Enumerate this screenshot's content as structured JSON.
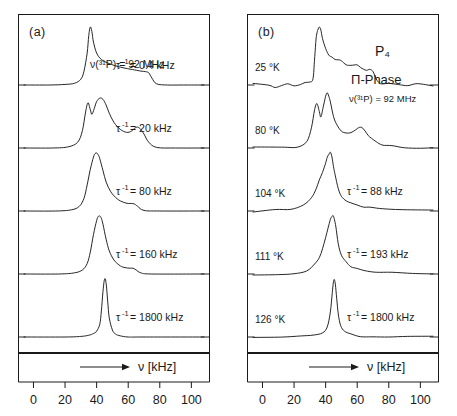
{
  "figure": {
    "background": "#ffffff",
    "line_color": "#1a1a1a",
    "panels": [
      {
        "id": "a",
        "tag": "(a)",
        "header_note": "ν(³¹P) = 92 MHz",
        "x_axis": {
          "arrow_label": "ν [kHz]",
          "ticks": [
            "0",
            "20",
            "40",
            "60",
            "80",
            "100"
          ],
          "tick_values": [
            0,
            20,
            40,
            60,
            80,
            100
          ],
          "range": [
            -6,
            108
          ],
          "unit": "kHz"
        },
        "traces": [
          {
            "label": "τ⁻¹ = 0.4 kHz",
            "tau_inv": "0.4",
            "unit": "kHz",
            "temperature": ""
          },
          {
            "label": "τ⁻¹ = 20 kHz",
            "tau_inv": "20",
            "unit": "kHz",
            "temperature": ""
          },
          {
            "label": "τ⁻¹ = 80 kHz",
            "tau_inv": "80",
            "unit": "kHz",
            "temperature": ""
          },
          {
            "label": "τ⁻¹ = 160 kHz",
            "tau_inv": "160",
            "unit": "kHz",
            "temperature": ""
          },
          {
            "label": "τ⁻¹ = 1800 kHz",
            "tau_inv": "1800",
            "unit": "kHz",
            "temperature": ""
          }
        ]
      },
      {
        "id": "b",
        "tag": "(b)",
        "title": "P₄",
        "subtitle": "Π-Phase",
        "header_note": "ν(³¹P) = 92 MHz",
        "x_axis": {
          "arrow_label": "ν [kHz]",
          "ticks": [
            "0",
            "20",
            "40",
            "60",
            "80",
            "100"
          ],
          "tick_values": [
            0,
            20,
            40,
            60,
            80,
            100
          ],
          "range": [
            -6,
            108
          ],
          "unit": "kHz"
        },
        "traces": [
          {
            "temperature": "25 °K",
            "label": ""
          },
          {
            "temperature": "80 °K",
            "label": ""
          },
          {
            "temperature": "104 °K",
            "label": "τ⁻¹ = 88 kHz",
            "tau_inv": "88",
            "unit": "kHz"
          },
          {
            "temperature": "111 °K",
            "label": "τ⁻¹ = 193 kHz",
            "tau_inv": "193",
            "unit": "kHz"
          },
          {
            "temperature": "126 °K",
            "label": "τ⁻¹ = 1800 kHz",
            "tau_inv": "1800",
            "unit": "kHz"
          }
        ]
      }
    ]
  },
  "chart_data": {
    "type": "line",
    "title": "",
    "xlabel": "ν [kHz]",
    "ylabel": "",
    "xlim": [
      -6,
      108
    ],
    "grid": false,
    "legend": "none",
    "panels": [
      {
        "panel": "(a)",
        "annotation": "ν(³¹P) = 92 MHz",
        "xticks": [
          0,
          20,
          40,
          60,
          80,
          100
        ],
        "series": [
          {
            "name": "τ⁻¹ = 0.4 kHz",
            "tau_inv_kHz": 0.4,
            "x": [
              -6,
              10,
              20,
              26,
              30,
              32,
              34,
              35,
              36,
              37,
              38,
              40,
              43,
              47,
              52,
              58,
              64,
              68,
              71,
              73,
              75,
              78,
              85,
              95,
              108
            ],
            "y": [
              0,
              0,
              0.01,
              0.03,
              0.1,
              0.24,
              0.55,
              0.85,
              1.0,
              0.92,
              0.74,
              0.55,
              0.44,
              0.38,
              0.33,
              0.29,
              0.26,
              0.24,
              0.23,
              0.21,
              0.12,
              0.02,
              0.0,
              0.0,
              0.0
            ]
          },
          {
            "name": "τ⁻¹ = 20 kHz",
            "tau_inv_kHz": 20,
            "x": [
              -6,
              12,
              22,
              28,
              31,
              33,
              34.5,
              36,
              37,
              38.5,
              40,
              42,
              44,
              46,
              48,
              51,
              55,
              59,
              62,
              64,
              66,
              68,
              70,
              73,
              78,
              90,
              108
            ],
            "y": [
              0,
              0,
              0.02,
              0.1,
              0.3,
              0.62,
              0.78,
              0.66,
              0.58,
              0.68,
              0.8,
              0.86,
              0.84,
              0.74,
              0.6,
              0.44,
              0.32,
              0.27,
              0.29,
              0.34,
              0.36,
              0.32,
              0.24,
              0.1,
              0.01,
              0.0,
              0.0
            ]
          },
          {
            "name": "τ⁻¹ = 80 kHz",
            "tau_inv_kHz": 80,
            "x": [
              -6,
              14,
              24,
              29,
              32,
              34,
              36,
              38,
              39,
              40,
              41,
              42,
              44,
              46,
              49,
              53,
              57,
              60,
              62,
              64,
              66,
              70,
              80,
              108
            ],
            "y": [
              0,
              0,
              0.02,
              0.08,
              0.22,
              0.45,
              0.72,
              0.93,
              0.99,
              1.0,
              0.97,
              0.9,
              0.7,
              0.5,
              0.33,
              0.21,
              0.15,
              0.13,
              0.13,
              0.12,
              0.08,
              0.01,
              0.0,
              0.0
            ]
          },
          {
            "name": "τ⁻¹ = 160 kHz",
            "tau_inv_kHz": 160,
            "x": [
              -6,
              16,
              26,
              31,
              34,
              36,
              38,
              40,
              41,
              42,
              43,
              44,
              46,
              48,
              51,
              55,
              58,
              61,
              63,
              65,
              68,
              75,
              108
            ],
            "y": [
              0,
              0,
              0.02,
              0.07,
              0.18,
              0.38,
              0.68,
              0.92,
              0.99,
              1.0,
              0.96,
              0.86,
              0.6,
              0.4,
              0.24,
              0.14,
              0.11,
              0.1,
              0.1,
              0.07,
              0.02,
              0.0,
              0.0
            ]
          },
          {
            "name": "τ⁻¹ = 1800 kHz",
            "tau_inv_kHz": 1800,
            "x": [
              -6,
              20,
              30,
              35,
              38,
              40,
              42,
              43,
              44,
              44.8,
              45.5,
              46.2,
              47,
              48,
              50,
              52,
              55,
              60,
              70,
              108
            ],
            "y": [
              0,
              0,
              0.01,
              0.03,
              0.06,
              0.1,
              0.22,
              0.45,
              0.78,
              0.97,
              1.0,
              0.88,
              0.62,
              0.33,
              0.12,
              0.05,
              0.02,
              0.0,
              0.0,
              0.0
            ]
          }
        ]
      },
      {
        "panel": "(b)",
        "annotation": "P₄, Π-Phase, ν(³¹P) = 92 MHz",
        "xticks": [
          0,
          20,
          40,
          60,
          80,
          100
        ],
        "series": [
          {
            "name": "25 °K",
            "temperature_K": 25,
            "x": [
              -6,
              4,
              8,
              12,
              16,
              20,
              24,
              27,
              30,
              32,
              33,
              34,
              35,
              36,
              37,
              38,
              40,
              42,
              44,
              46,
              48,
              50,
              53,
              56,
              58,
              60,
              62,
              64,
              66,
              68,
              70,
              72,
              74,
              76,
              80,
              86,
              92,
              98,
              108
            ],
            "y": [
              0.01,
              0.0,
              -0.04,
              0.0,
              0.01,
              0.0,
              0.02,
              0.06,
              0.05,
              0.12,
              0.45,
              0.8,
              0.95,
              1.0,
              0.95,
              0.8,
              0.62,
              0.52,
              0.47,
              0.44,
              0.43,
              0.41,
              0.36,
              0.33,
              0.34,
              0.33,
              0.3,
              0.28,
              0.27,
              0.26,
              0.22,
              0.12,
              0.05,
              0.02,
              0.01,
              0.02,
              0.0,
              0.01,
              0.0
            ]
          },
          {
            "name": "80 °K",
            "temperature_K": 80,
            "x": [
              -6,
              6,
              14,
              22,
              28,
              31,
              33,
              34.5,
              36,
              37,
              38.5,
              40,
              41,
              42,
              43,
              45,
              47,
              50,
              53,
              56,
              59,
              61,
              63,
              65,
              67,
              69,
              72,
              76,
              82,
              90,
              100,
              108
            ],
            "y": [
              0.0,
              0.01,
              0.0,
              0.02,
              0.1,
              0.34,
              0.66,
              0.78,
              0.64,
              0.55,
              0.7,
              0.88,
              0.96,
              0.9,
              0.78,
              0.55,
              0.4,
              0.29,
              0.25,
              0.26,
              0.31,
              0.36,
              0.34,
              0.28,
              0.22,
              0.17,
              0.11,
              0.06,
              0.03,
              0.02,
              0.01,
              0.0
            ]
          },
          {
            "name": "104 °K",
            "temperature_K": 104,
            "tau_inv_kHz": 88,
            "x": [
              -6,
              8,
              18,
              26,
              31,
              34,
              36,
              38,
              40,
              41,
              42,
              43,
              44,
              45,
              46,
              48,
              50,
              53,
              56,
              60,
              64,
              68,
              74,
              82,
              92,
              108
            ],
            "y": [
              0.0,
              0.01,
              0.03,
              0.1,
              0.22,
              0.38,
              0.52,
              0.66,
              0.82,
              0.92,
              0.99,
              1.0,
              0.92,
              0.78,
              0.62,
              0.4,
              0.27,
              0.18,
              0.13,
              0.09,
              0.07,
              0.05,
              0.03,
              0.02,
              0.01,
              0.0
            ]
          },
          {
            "name": "111 °K",
            "temperature_K": 111,
            "tau_inv_kHz": 193,
            "x": [
              -6,
              10,
              20,
              28,
              33,
              36,
              38,
              40,
              41.5,
              43,
              44,
              44.8,
              45.6,
              46.5,
              48,
              50,
              53,
              56,
              60,
              65,
              72,
              82,
              95,
              108
            ],
            "y": [
              0.0,
              0.0,
              0.02,
              0.07,
              0.16,
              0.28,
              0.42,
              0.62,
              0.8,
              0.94,
              0.99,
              1.0,
              0.94,
              0.8,
              0.52,
              0.33,
              0.2,
              0.14,
              0.09,
              0.06,
              0.03,
              0.02,
              0.01,
              0.0
            ]
          },
          {
            "name": "126 °K",
            "temperature_K": 126,
            "tau_inv_kHz": 1800,
            "x": [
              -6,
              12,
              24,
              32,
              38,
              41,
              43,
              44.2,
              45,
              45.6,
              46.2,
              47,
              48,
              49.5,
              52,
              56,
              62,
              70,
              80,
              92,
              108
            ],
            "y": [
              0.01,
              0.0,
              0.01,
              0.03,
              0.07,
              0.16,
              0.42,
              0.76,
              0.95,
              1.0,
              0.9,
              0.66,
              0.4,
              0.2,
              0.09,
              0.04,
              0.02,
              0.01,
              0.01,
              0.0,
              0.0
            ]
          }
        ]
      }
    ]
  }
}
